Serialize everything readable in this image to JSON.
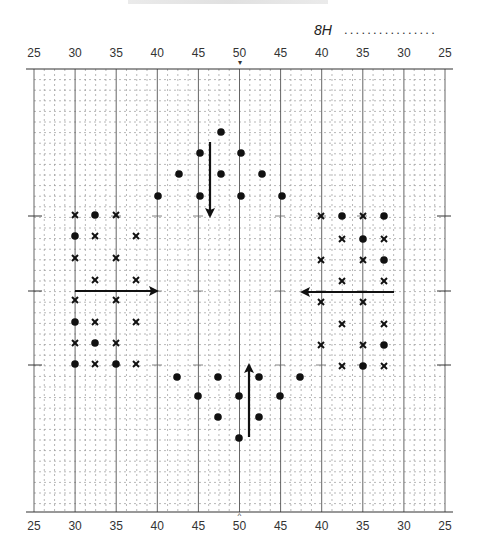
{
  "header": {
    "chart_id": "8H",
    "fill_line": "................"
  },
  "axis": {
    "top_labels": [
      "25",
      "30",
      "35",
      "40",
      "45",
      "50",
      "45",
      "40",
      "35",
      "30",
      "25"
    ],
    "bottom_labels": [
      "25",
      "30",
      "35",
      "40",
      "45",
      "50",
      "45",
      "40",
      "35",
      "30",
      "25"
    ],
    "center_marker_top": "▾",
    "center_marker_bottom": "^"
  },
  "chart_data": {
    "type": "scatter",
    "title": "8H",
    "x_tick_labels": [
      "25",
      "30",
      "35",
      "40",
      "45",
      "50",
      "45",
      "40",
      "35",
      "30",
      "25"
    ],
    "grid": true,
    "grid_major_every": 5,
    "grid_minor_every": 1,
    "marks": {
      "top_cluster": {
        "dots": [
          [
            221,
            132
          ],
          [
            200,
            153
          ],
          [
            241,
            153
          ],
          [
            179,
            174
          ],
          [
            221,
            174
          ],
          [
            262,
            174
          ],
          [
            158,
            196
          ],
          [
            200,
            196
          ],
          [
            241,
            196
          ],
          [
            282,
            196
          ]
        ],
        "arrow": {
          "x1": 210,
          "y1": 142,
          "x2": 210,
          "y2": 216,
          "direction": "down"
        }
      },
      "bottom_cluster": {
        "dots": [
          [
            177,
            377
          ],
          [
            218,
            377
          ],
          [
            259,
            377
          ],
          [
            300,
            377
          ],
          [
            198,
            396
          ],
          [
            239,
            396
          ],
          [
            280,
            396
          ],
          [
            218,
            417
          ],
          [
            259,
            417
          ],
          [
            239,
            438
          ]
        ],
        "arrow": {
          "x1": 249,
          "y1": 437,
          "x2": 249,
          "y2": 365,
          "direction": "up"
        }
      },
      "left_cluster": {
        "crosses": [
          [
            75,
            215
          ],
          [
            116,
            215
          ],
          [
            95,
            236
          ],
          [
            136,
            236
          ],
          [
            75,
            258
          ],
          [
            116,
            258
          ],
          [
            95,
            280
          ],
          [
            136,
            280
          ],
          [
            75,
            300
          ],
          [
            116,
            300
          ],
          [
            95,
            322
          ],
          [
            136,
            322
          ],
          [
            75,
            343
          ],
          [
            116,
            343
          ],
          [
            95,
            364
          ],
          [
            136,
            364
          ]
        ],
        "dots": [
          [
            95,
            215
          ],
          [
            75,
            236
          ],
          [
            75,
            322
          ],
          [
            95,
            343
          ],
          [
            75,
            364
          ],
          [
            116,
            364
          ]
        ],
        "arrow": {
          "x1": 75,
          "y1": 291,
          "x2": 157,
          "y2": 291,
          "direction": "right"
        }
      },
      "right_cluster": {
        "crosses": [
          [
            321,
            216
          ],
          [
            363,
            216
          ],
          [
            342,
            239
          ],
          [
            384,
            239
          ],
          [
            321,
            260
          ],
          [
            363,
            260
          ],
          [
            342,
            281
          ],
          [
            384,
            281
          ],
          [
            321,
            302
          ],
          [
            363,
            302
          ],
          [
            342,
            324
          ],
          [
            384,
            324
          ],
          [
            321,
            345
          ],
          [
            363,
            345
          ],
          [
            342,
            366
          ],
          [
            384,
            366
          ]
        ],
        "dots": [
          [
            342,
            216
          ],
          [
            384,
            216
          ],
          [
            363,
            239
          ],
          [
            384,
            260
          ],
          [
            384,
            345
          ],
          [
            363,
            366
          ]
        ],
        "arrow": {
          "x1": 394,
          "y1": 292,
          "x2": 302,
          "y2": 292,
          "direction": "left"
        }
      }
    },
    "side_ticks_y": [
      216,
      291,
      365
    ]
  }
}
